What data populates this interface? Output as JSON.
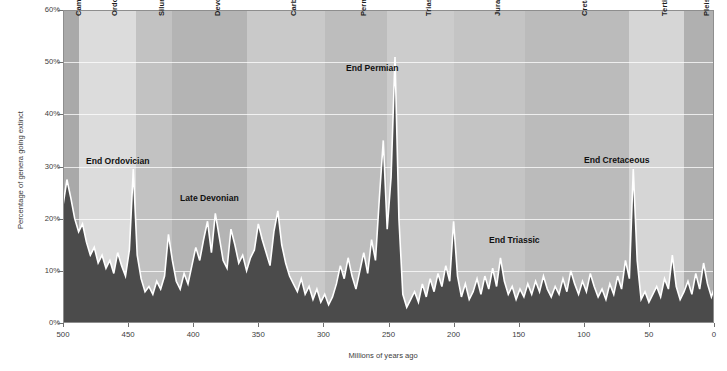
{
  "chart_data": {
    "type": "area",
    "title": "",
    "xlabel": "Millions of years ago",
    "ylabel": "Percentage of genera going extinct",
    "xlim": [
      500,
      0
    ],
    "ylim": [
      0,
      60
    ],
    "x_ticks": [
      "500",
      "450",
      "400",
      "350",
      "300",
      "250",
      "200",
      "150",
      "100",
      "50",
      "0"
    ],
    "x_tick_values": [
      500,
      450,
      400,
      350,
      300,
      250,
      200,
      150,
      100,
      50,
      0
    ],
    "y_ticks": [
      "0%",
      "10%",
      "20%",
      "30%",
      "40%",
      "50%",
      "60%"
    ],
    "y_tick_values": [
      0,
      10,
      20,
      30,
      40,
      50,
      60
    ],
    "grid": "horizontal",
    "legend_position": "none",
    "series_name": "Extinction intensity",
    "area_color": "#4b4b4b",
    "line_color": "#ffffff",
    "x": [
      500,
      497,
      494,
      491,
      488,
      485,
      482,
      479,
      476,
      473,
      470,
      467,
      464,
      461,
      458,
      455,
      452,
      449,
      446,
      443,
      440,
      437,
      434,
      431,
      428,
      425,
      422,
      419,
      416,
      413,
      410,
      407,
      404,
      401,
      398,
      395,
      392,
      389,
      386,
      383,
      380,
      377,
      374,
      371,
      368,
      365,
      362,
      359,
      356,
      353,
      350,
      347,
      344,
      341,
      338,
      335,
      332,
      329,
      326,
      323,
      320,
      317,
      314,
      311,
      308,
      305,
      302,
      299,
      296,
      293,
      290,
      287,
      284,
      281,
      278,
      275,
      272,
      269,
      266,
      263,
      260,
      257,
      254,
      251,
      248,
      245,
      242,
      239,
      236,
      233,
      230,
      227,
      224,
      221,
      218,
      215,
      212,
      209,
      206,
      203,
      200,
      197,
      194,
      191,
      188,
      185,
      182,
      179,
      176,
      173,
      170,
      167,
      164,
      161,
      158,
      155,
      152,
      149,
      146,
      143,
      140,
      137,
      134,
      131,
      128,
      125,
      122,
      119,
      116,
      113,
      110,
      107,
      104,
      101,
      98,
      95,
      92,
      89,
      86,
      83,
      80,
      77,
      74,
      71,
      68,
      65,
      62,
      59,
      56,
      53,
      50,
      47,
      44,
      41,
      38,
      35,
      32,
      29,
      26,
      23,
      20,
      17,
      14,
      11,
      8,
      5,
      2,
      0
    ],
    "y": [
      22.5,
      27.5,
      24.0,
      20.0,
      17.5,
      19.0,
      15.5,
      13.0,
      14.5,
      11.5,
      13.0,
      10.5,
      12.0,
      9.5,
      13.5,
      11.0,
      9.0,
      14.0,
      29.5,
      13.0,
      8.5,
      6.0,
      7.0,
      5.5,
      8.0,
      6.5,
      9.0,
      17.0,
      12.0,
      8.0,
      6.5,
      9.5,
      7.5,
      11.0,
      14.5,
      12.0,
      16.0,
      19.5,
      13.5,
      21.0,
      16.5,
      12.0,
      10.5,
      18.0,
      15.0,
      11.5,
      13.0,
      10.0,
      12.5,
      14.0,
      19.0,
      16.0,
      13.5,
      11.0,
      17.5,
      21.5,
      15.0,
      11.5,
      9.0,
      7.5,
      6.0,
      8.5,
      5.5,
      7.0,
      4.5,
      6.5,
      4.0,
      5.5,
      3.5,
      5.0,
      7.5,
      11.0,
      8.5,
      12.5,
      9.0,
      6.5,
      10.0,
      13.5,
      9.5,
      16.0,
      12.0,
      24.0,
      35.0,
      18.0,
      28.0,
      51.0,
      20.0,
      5.5,
      3.0,
      4.5,
      6.0,
      4.0,
      7.5,
      5.0,
      8.5,
      6.0,
      9.5,
      7.0,
      11.0,
      8.0,
      19.5,
      9.0,
      5.0,
      7.5,
      4.5,
      6.0,
      8.5,
      5.5,
      9.0,
      6.5,
      10.5,
      7.0,
      12.5,
      8.0,
      5.5,
      7.0,
      4.5,
      6.5,
      5.0,
      7.5,
      5.5,
      8.0,
      6.0,
      9.0,
      6.5,
      5.0,
      7.0,
      5.5,
      8.5,
      6.0,
      10.0,
      7.5,
      5.5,
      8.0,
      6.0,
      9.5,
      7.0,
      5.0,
      6.5,
      4.5,
      7.5,
      5.5,
      9.0,
      6.5,
      12.0,
      8.5,
      29.5,
      12.0,
      4.5,
      6.0,
      4.0,
      5.5,
      7.0,
      5.0,
      8.5,
      6.5,
      13.0,
      7.0,
      4.5,
      6.0,
      8.0,
      5.5,
      9.5,
      6.5,
      11.5,
      7.5,
      5.0,
      6.5,
      4.0,
      5.5,
      3.5,
      5.0,
      4.0,
      4.5
    ]
  },
  "periods": [
    {
      "name": "Cambrian",
      "start": 500,
      "end": 488,
      "shade": "#a9a9a9"
    },
    {
      "name": "Ordovician",
      "start": 488,
      "end": 444,
      "shade": "#dcdcdc"
    },
    {
      "name": "Silurian",
      "start": 444,
      "end": 416,
      "shade": "#c2c2c2"
    },
    {
      "name": "Devonian",
      "start": 416,
      "end": 359,
      "shade": "#b4b4b4"
    },
    {
      "name": "Carboniferous",
      "start": 359,
      "end": 299,
      "shade": "#c9c9c9"
    },
    {
      "name": "Permian",
      "start": 299,
      "end": 251,
      "shade": "#bdbdbd"
    },
    {
      "name": "Triassic",
      "start": 251,
      "end": 200,
      "shade": "#cccccc"
    },
    {
      "name": "Jurassic",
      "start": 200,
      "end": 145,
      "shade": "#c4c4c4"
    },
    {
      "name": "Cretaceous",
      "start": 145,
      "end": 65,
      "shade": "#bbbbbb"
    },
    {
      "name": "Tertiary",
      "start": 65,
      "end": 23,
      "shade": "#d6d6d6"
    },
    {
      "name": "Pleistogene",
      "start": 23,
      "end": 0,
      "shade": "#b0b0b0"
    }
  ],
  "events": [
    {
      "label": "End Ordovician",
      "x_left": 86,
      "y_top": 156
    },
    {
      "label": "Late Devonian",
      "x_left": 180,
      "y_top": 193
    },
    {
      "label": "End Permian",
      "x_left": 346,
      "y_top": 63
    },
    {
      "label": "End Triassic",
      "x_left": 489,
      "y_top": 235
    },
    {
      "label": "End Cretaceous",
      "x_left": 584,
      "y_top": 155
    }
  ]
}
